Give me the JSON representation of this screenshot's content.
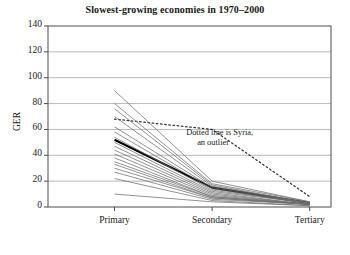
{
  "chart_data": {
    "type": "line",
    "title": "Slowest-growing economies in 1970–2000",
    "xlabel": "",
    "ylabel": "GER",
    "categories": [
      "Primary",
      "Secondary",
      "Tertiary"
    ],
    "ylim": [
      0,
      140
    ],
    "yticks": [
      0,
      20,
      40,
      60,
      80,
      100,
      120,
      140
    ],
    "grid": true,
    "legend": "none",
    "annotations": [
      {
        "text_line1": "Dotted line is Syria,",
        "text_line2": "an outlier",
        "x_category": "Secondary",
        "y_value": 52
      }
    ],
    "series": [
      {
        "name": "Syria",
        "style": "dotted",
        "emphasis": "outlier",
        "values": [
          68,
          60,
          8
        ]
      },
      {
        "name": "bold-mean-line",
        "style": "solid-bold",
        "emphasis": "highlight",
        "values": [
          52,
          15,
          3
        ]
      },
      {
        "name": "country-01",
        "style": "solid-thin",
        "values": [
          90,
          20,
          4
        ]
      },
      {
        "name": "country-02",
        "style": "solid-thin",
        "values": [
          80,
          18,
          4
        ]
      },
      {
        "name": "country-03",
        "style": "solid-thin",
        "values": [
          76,
          17,
          3
        ]
      },
      {
        "name": "country-04",
        "style": "solid-thin",
        "values": [
          70,
          16,
          3
        ]
      },
      {
        "name": "country-05",
        "style": "solid-thin",
        "values": [
          62,
          15,
          3
        ]
      },
      {
        "name": "country-06",
        "style": "solid-thin",
        "values": [
          58,
          14,
          3
        ]
      },
      {
        "name": "country-07",
        "style": "solid-thin",
        "values": [
          54,
          13,
          3
        ]
      },
      {
        "name": "country-08",
        "style": "solid-thin",
        "values": [
          50,
          12,
          3
        ]
      },
      {
        "name": "country-09",
        "style": "solid-thin",
        "values": [
          47,
          11,
          2
        ]
      },
      {
        "name": "country-10",
        "style": "solid-thin",
        "values": [
          44,
          10,
          2
        ]
      },
      {
        "name": "country-11",
        "style": "solid-thin",
        "values": [
          41,
          9,
          2
        ]
      },
      {
        "name": "country-12",
        "style": "solid-thin",
        "values": [
          38,
          8,
          2
        ]
      },
      {
        "name": "country-13",
        "style": "solid-thin",
        "values": [
          35,
          8,
          2
        ]
      },
      {
        "name": "country-14",
        "style": "solid-thin",
        "values": [
          33,
          7,
          2
        ]
      },
      {
        "name": "country-15",
        "style": "solid-thin",
        "values": [
          30,
          7,
          2
        ]
      },
      {
        "name": "country-16",
        "style": "solid-thin",
        "values": [
          27,
          6,
          2
        ]
      },
      {
        "name": "country-17",
        "style": "solid-thin",
        "values": [
          22,
          5,
          1
        ]
      },
      {
        "name": "country-18",
        "style": "solid-thin",
        "values": [
          10,
          4,
          1
        ]
      }
    ],
    "colors": {
      "axis": "#4d4d4d",
      "grid": "#9a9a9a",
      "line": "#6e6e6e",
      "bold_line": "#000000",
      "text": "#1a1a1a",
      "background": "#ffffff"
    }
  }
}
